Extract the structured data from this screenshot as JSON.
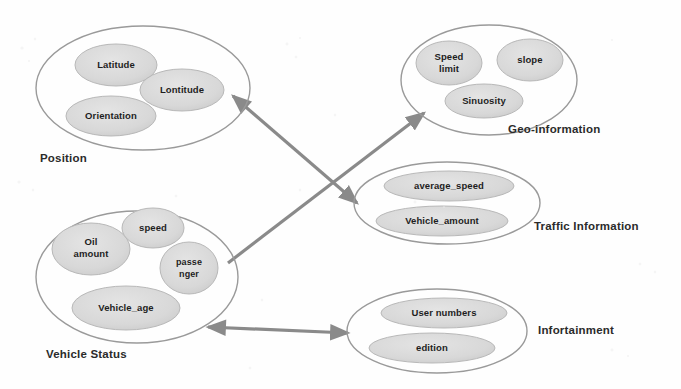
{
  "diagram": {
    "background_color": "#fefefe",
    "cluster_outline_color": "#9a9a9a",
    "node_fill_color": "#d9d9d9",
    "node_outline_color": "#b4b4b4",
    "arrow_color": "#8a8a8a",
    "label_color": "#2b2b2b",
    "clusters": [
      {
        "id": "position",
        "label": "Position",
        "nodes": [
          {
            "id": "latitude",
            "label": "Latitude"
          },
          {
            "id": "lontitude",
            "label": "Lontitude"
          },
          {
            "id": "orientation",
            "label": "Orientation"
          }
        ]
      },
      {
        "id": "geo-information",
        "label": "Geo-information",
        "nodes": [
          {
            "id": "speed-limit",
            "label": "Speed limit",
            "line1": "Speed",
            "line2": "limit"
          },
          {
            "id": "slope",
            "label": "slope"
          },
          {
            "id": "sinuosity",
            "label": "Sinuosity"
          }
        ]
      },
      {
        "id": "traffic-information",
        "label": "Traffic Information",
        "nodes": [
          {
            "id": "average-speed",
            "label": "average_speed"
          },
          {
            "id": "vehicle-amount",
            "label": "Vehicle_amount"
          }
        ]
      },
      {
        "id": "vehicle-status",
        "label": "Vehicle Status",
        "nodes": [
          {
            "id": "oil-amount",
            "label": "Oil amount",
            "line1": "Oil",
            "line2": "amount"
          },
          {
            "id": "speed",
            "label": "speed"
          },
          {
            "id": "passenger",
            "label": "passenger",
            "line1": "passe",
            "line2": "nger"
          },
          {
            "id": "vehicle-age",
            "label": "Vehicle_age"
          }
        ]
      },
      {
        "id": "infortainment",
        "label": "Infortainment",
        "nodes": [
          {
            "id": "user-numbers",
            "label": "User numbers"
          },
          {
            "id": "edition",
            "label": "edition"
          }
        ]
      }
    ],
    "connections": [
      {
        "id": "position-traffic",
        "from": "position",
        "to": "traffic-information",
        "direction": "bidirectional"
      },
      {
        "id": "vehicle-status-geo",
        "from": "vehicle-status",
        "to": "geo-information",
        "direction": "to"
      },
      {
        "id": "vehicle-status-infortainment",
        "from": "vehicle-status",
        "to": "infortainment",
        "direction": "bidirectional"
      }
    ]
  }
}
